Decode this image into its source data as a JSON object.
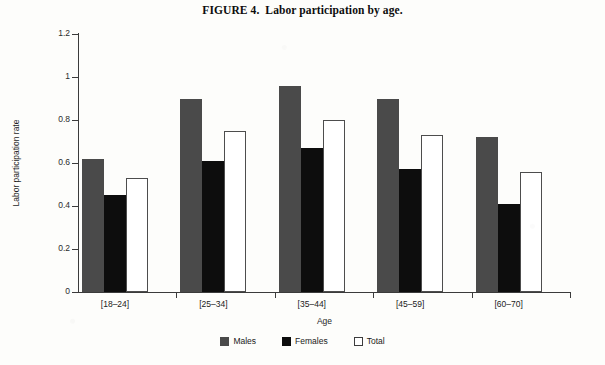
{
  "title": "FIGURE 4.  Labor participation by age.",
  "axes": {
    "x_title": "Age",
    "y_title": "Labor participation rate",
    "y_ticks": [
      "0",
      "0.2",
      "0.4",
      "0.6",
      "0.8",
      "1",
      "1.2"
    ]
  },
  "legend": {
    "position": "bottom-center",
    "items": [
      {
        "label": "Males",
        "swatch": "males-swatch",
        "color": "#4a4a4a"
      },
      {
        "label": "Females",
        "swatch": "females-swatch",
        "color": "#0d0d0d"
      },
      {
        "label": "Total",
        "swatch": "total-swatch",
        "color": "#ffffff"
      }
    ]
  },
  "chart_data": {
    "type": "bar",
    "title": "FIGURE 4.  Labor participation by age.",
    "xlabel": "Age",
    "ylabel": "Labor participation rate",
    "ylim": [
      0,
      1.2
    ],
    "ytick_step": 0.2,
    "grid": false,
    "categories": [
      "[18–24]",
      "[25–34]",
      "[35–44]",
      "[45–59]",
      "[60–70]"
    ],
    "series": [
      {
        "name": "Males",
        "color": "#4a4a4a",
        "values": [
          0.62,
          0.9,
          0.96,
          0.9,
          0.72
        ]
      },
      {
        "name": "Females",
        "color": "#0d0d0d",
        "values": [
          0.45,
          0.61,
          0.67,
          0.57,
          0.41
        ]
      },
      {
        "name": "Total",
        "color": "#ffffff",
        "values": [
          0.53,
          0.75,
          0.8,
          0.73,
          0.56
        ]
      }
    ]
  }
}
